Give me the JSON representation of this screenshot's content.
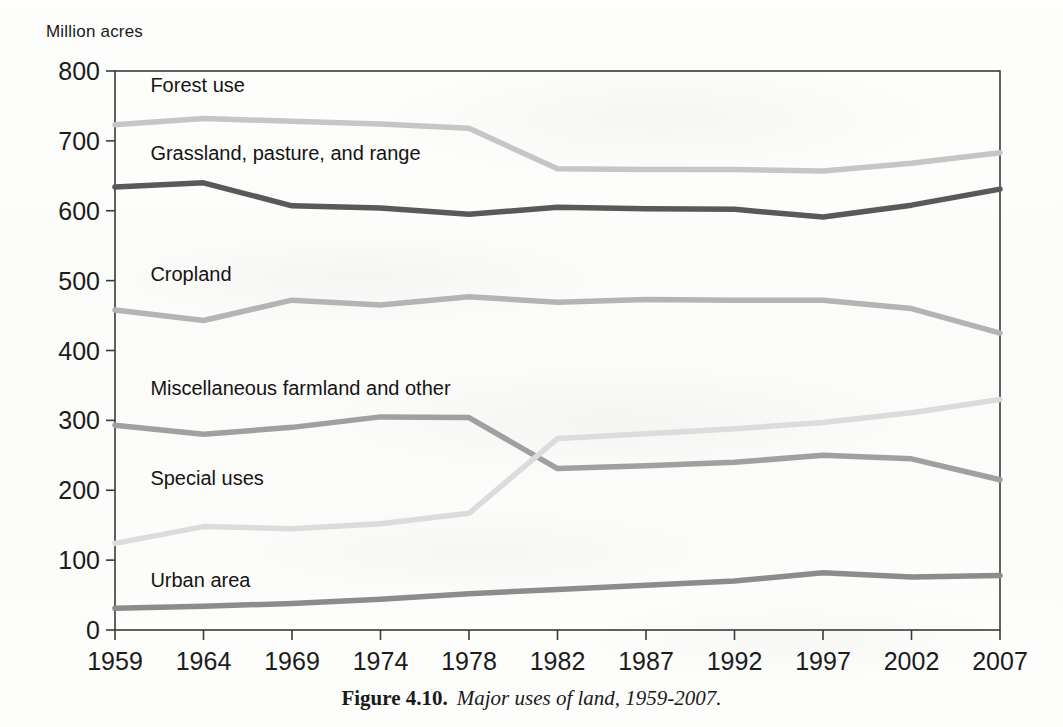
{
  "figure": {
    "caption_label": "Figure 4.10.",
    "caption_text": "Major uses of land, 1959-2007.",
    "axis_unit_label": "Million acres"
  },
  "chart_data": {
    "type": "line",
    "title": "",
    "subtitle": "",
    "xlabel": "",
    "ylabel": "Million acres",
    "x": [
      1959,
      1964,
      1969,
      1974,
      1978,
      1982,
      1987,
      1992,
      1997,
      2002,
      2007
    ],
    "xtick_labels": [
      "1959",
      "1964",
      "1969",
      "1974",
      "1978",
      "1982",
      "1987",
      "1992",
      "1997",
      "2002",
      "2007"
    ],
    "ytick_labels": [
      "0",
      "100",
      "200",
      "300",
      "400",
      "500",
      "600",
      "700",
      "800"
    ],
    "yticks": [
      0,
      100,
      200,
      300,
      400,
      500,
      600,
      700,
      800
    ],
    "ylim": [
      0,
      800
    ],
    "grid": false,
    "legend": "inline-labels",
    "series": [
      {
        "name": "Forest use",
        "color": "#c6c6c6",
        "label_x": 1961.0,
        "label_y": 770,
        "values": [
          723,
          732,
          728,
          724,
          718,
          660,
          659,
          659,
          657,
          668,
          683
        ]
      },
      {
        "name": "Grassland, pasture, and range",
        "color": "#595959",
        "label_x": 1961.0,
        "label_y": 672,
        "values": [
          634,
          640,
          607,
          604,
          595,
          605,
          603,
          602,
          591,
          608,
          631
        ]
      },
      {
        "name": "Cropland",
        "color": "#b4b4b4",
        "label_x": 1961.0,
        "label_y": 500,
        "values": [
          458,
          443,
          472,
          465,
          477,
          469,
          473,
          472,
          472,
          460,
          425
        ]
      },
      {
        "name": "Miscellaneous farmland and other",
        "color": "#a0a0a0",
        "label_x": 1961.0,
        "label_y": 337,
        "values": [
          293,
          280,
          290,
          305,
          304,
          231,
          235,
          240,
          250,
          245,
          215
        ]
      },
      {
        "name": "Special uses",
        "color": "#dcdcdc",
        "label_x": 1961.0,
        "label_y": 208,
        "values": [
          124,
          148,
          145,
          152,
          167,
          274,
          281,
          288,
          297,
          311,
          330
        ]
      },
      {
        "name": "Urban area",
        "color": "#8c8c8c",
        "label_x": 1961.0,
        "label_y": 62,
        "values": [
          31,
          34,
          38,
          44,
          52,
          58,
          64,
          70,
          82,
          76,
          78
        ]
      }
    ]
  }
}
